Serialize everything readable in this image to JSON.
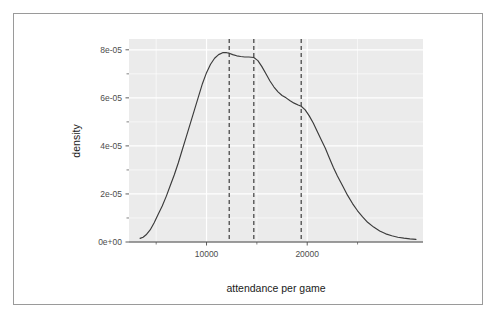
{
  "chart_data": {
    "type": "line",
    "title": "",
    "subtitle": "",
    "xlabel": "attendance per game",
    "ylabel": "density",
    "xlim": [
      2300,
      31500
    ],
    "ylim": [
      0,
      8.45e-05
    ],
    "grid": true,
    "legend": "none",
    "panel_background": "#ebebeb",
    "grid_major_color": "#ffffff",
    "grid_minor_color": "#ffffff",
    "line_color": "#3b3b3b",
    "vline_color": "#1a1a1a",
    "x_ticks": [
      10000,
      20000
    ],
    "x_tick_labels": [
      "10000",
      "20000"
    ],
    "x_minor_ticks": [
      5000,
      15000,
      25000
    ],
    "y_ticks": [
      0,
      2e-05,
      4e-05,
      6e-05,
      8e-05
    ],
    "y_tick_labels": [
      "0e+00",
      "2e-05",
      "4e-05",
      "6e-05",
      "8e-05"
    ],
    "y_minor_ticks": [
      1e-05,
      3e-05,
      5e-05,
      7e-05
    ],
    "vertical_reference_lines": [
      {
        "x": 12250,
        "style": "dashed"
      },
      {
        "x": 14700,
        "style": "dashed"
      },
      {
        "x": 19400,
        "style": "dashed"
      }
    ],
    "series": [
      {
        "name": "density",
        "x": [
          3400,
          3700,
          4000,
          4400,
          4800,
          5200,
          5600,
          6000,
          6400,
          6800,
          7200,
          7600,
          8000,
          8400,
          8800,
          9200,
          9600,
          10000,
          10400,
          10800,
          11200,
          11600,
          12000,
          12250,
          12600,
          13000,
          13400,
          13800,
          14200,
          14700,
          15100,
          15500,
          15900,
          16300,
          16700,
          17100,
          17500,
          17900,
          18300,
          18700,
          19100,
          19400,
          19800,
          20200,
          20600,
          21000,
          21400,
          21800,
          22200,
          22600,
          23000,
          23500,
          24000,
          24500,
          25000,
          25500,
          26000,
          26600,
          27200,
          27800,
          28400,
          29000,
          29600,
          30200,
          30800
        ],
        "y": [
          1.5e-06,
          2e-06,
          3e-06,
          5e-06,
          8e-06,
          1.15e-05,
          1.5e-05,
          1.9e-05,
          2.35e-05,
          2.8e-05,
          3.3e-05,
          3.85e-05,
          4.4e-05,
          4.95e-05,
          5.5e-05,
          6.05e-05,
          6.6e-05,
          7.05e-05,
          7.4e-05,
          7.65e-05,
          7.8e-05,
          7.88e-05,
          7.88e-05,
          7.86e-05,
          7.8e-05,
          7.75e-05,
          7.72e-05,
          7.7e-05,
          7.7e-05,
          7.68e-05,
          7.55e-05,
          7.3e-05,
          7e-05,
          6.7e-05,
          6.45e-05,
          6.25e-05,
          6.1e-05,
          6e-05,
          5.88e-05,
          5.78e-05,
          5.7e-05,
          5.65e-05,
          5.5e-05,
          5.25e-05,
          4.95e-05,
          4.6e-05,
          4.25e-05,
          3.9e-05,
          3.5e-05,
          3.1e-05,
          2.75e-05,
          2.35e-05,
          1.95e-05,
          1.6e-05,
          1.3e-05,
          1.05e-05,
          8.2e-06,
          6.2e-06,
          4.6e-06,
          3.4e-06,
          2.6e-06,
          2e-06,
          1.6e-06,
          1.3e-06,
          1.1e-06
        ]
      }
    ]
  },
  "axes": {
    "x_title": "attendance per game",
    "y_title": "density",
    "x_tick_labels": [
      "10000",
      "20000"
    ],
    "y_tick_labels": [
      "0e+00",
      "2e-05",
      "4e-05",
      "6e-05",
      "8e-05"
    ]
  }
}
